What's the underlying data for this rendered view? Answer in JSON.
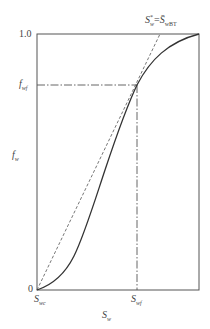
{
  "diagram": {
    "type": "fractional-flow-curve",
    "y_axis": {
      "label_base": "f",
      "label_sub": "w",
      "ticks": [
        {
          "label": "0",
          "value": 0
        },
        {
          "label": "1.0",
          "value": 1.0
        },
        {
          "label_base": "f",
          "label_sub": "wf",
          "value": 0.8
        }
      ]
    },
    "x_axis": {
      "label_base": "S",
      "label_sub": "w",
      "ticks": [
        {
          "label_base": "S",
          "label_sub": "wc",
          "value": 0
        },
        {
          "label_base": "S",
          "label_sub": "wf",
          "value": 0.62
        }
      ]
    },
    "annotation": {
      "left_base": "S",
      "left_sup": "*",
      "left_sub": "w",
      "equals": "=",
      "right_base": "S̄",
      "right_sub": "wBT"
    },
    "series": [
      {
        "name": "fractional-flow-curve",
        "style": "solid",
        "color": "#333333"
      },
      {
        "name": "tangent-line",
        "style": "dashed",
        "color": "#555555"
      },
      {
        "name": "fwf-guide",
        "style": "dash-dot",
        "color": "#444444"
      },
      {
        "name": "swf-guide",
        "style": "dash-dot",
        "color": "#444444"
      }
    ]
  }
}
